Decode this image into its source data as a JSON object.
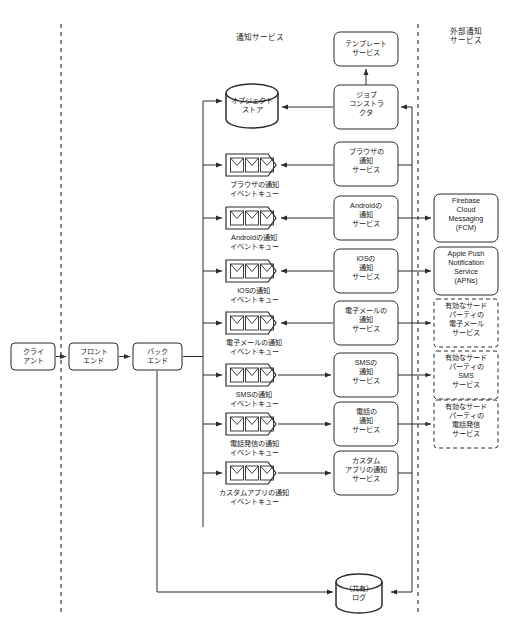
{
  "diagram": {
    "type": "architecture-flow",
    "colors": {
      "stroke": "#2b2b2b",
      "background": "#ffffff",
      "text": "#1a1a1a",
      "divider": "#333333"
    },
    "zones": [
      {
        "id": "notification-service",
        "label": "通知サービス"
      },
      {
        "id": "external-notification-service",
        "label": "外部通知\nサービス"
      }
    ],
    "left_chain": [
      {
        "id": "client",
        "label": "クライ\nアント"
      },
      {
        "id": "frontend",
        "label": "フロント\nエンド"
      },
      {
        "id": "backend",
        "label": "バック\nエンド"
      }
    ],
    "stores": [
      {
        "id": "object-store",
        "label": "オブジェクト\nストア"
      },
      {
        "id": "shared-log",
        "label": "（共有）\nログ"
      }
    ],
    "top_nodes": [
      {
        "id": "template-service",
        "label": "テンプレート\nサービス"
      },
      {
        "id": "job-constructor",
        "label": "ジョブ\nコンストラ\nクタ"
      }
    ],
    "rows": [
      {
        "id": "browser",
        "queue_label": "ブラウザの通知\nイベントキュー",
        "service_label": "ブラウザの\n通知\nサービス",
        "external_label": null,
        "external_dashed": false,
        "direction": "service-to-queue"
      },
      {
        "id": "android",
        "queue_label": "Androidの通知\nイベントキュー",
        "service_label": "Androidの\n通知\nサービス",
        "external_label": "Firebase\nCloud\nMessaging\n(FCM)",
        "external_dashed": false,
        "direction": "service-to-queue"
      },
      {
        "id": "ios",
        "queue_label": "iOSの通知\nイベントキュー",
        "service_label": "iOSの\n通知\nサービス",
        "external_label": "Apple Push\nNotification\nService\n(APNs)",
        "external_dashed": false,
        "direction": "service-to-queue"
      },
      {
        "id": "email",
        "queue_label": "電子メールの通知\nイベントキュー",
        "service_label": "電子メールの\n通知\nサービス",
        "external_label": "有効なサード\nパーティの\n電子メール\nサービス",
        "external_dashed": true,
        "direction": "service-to-queue"
      },
      {
        "id": "sms",
        "queue_label": "SMSの通知\nイベントキュー",
        "service_label": "SMSの\n通知\nサービス",
        "external_label": "有効なサード\nパーティの\nSMS\nサービス",
        "external_dashed": true,
        "direction": "queue-to-service"
      },
      {
        "id": "phone",
        "queue_label": "電話発信の通知\nイベントキュー",
        "service_label": "電話の\n通知\nサービス",
        "external_label": "有効なサード\nパーティの\n電話発信\nサービス",
        "external_dashed": true,
        "direction": "queue-to-service"
      },
      {
        "id": "custom-app",
        "queue_label": "カスタムアプリの通知\nイベントキュー",
        "service_label": "カスタム\nアプリの通知\nサービス",
        "external_label": null,
        "external_dashed": false,
        "direction": "queue-to-service"
      }
    ],
    "icons": {
      "envelope": "envelope-icon",
      "cylinder": "database-cylinder-icon",
      "arrow": "arrow-head-icon"
    }
  }
}
